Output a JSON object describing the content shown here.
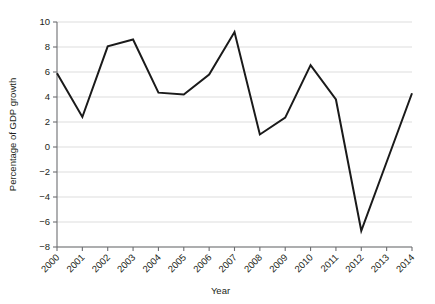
{
  "chart_data": {
    "type": "line",
    "title": "",
    "xlabel": "Year",
    "ylabel": "Percentage of GDP growth",
    "categories": [
      "2000",
      "2001",
      "2002",
      "2003",
      "2004",
      "2005",
      "2006",
      "2007",
      "2008",
      "2009",
      "2010",
      "2011",
      "2012",
      "2013",
      "2014"
    ],
    "x": [
      2000,
      2001,
      2002,
      2003,
      2004,
      2005,
      2006,
      2007,
      2008,
      2009,
      2010,
      2011,
      2012,
      2013,
      2014
    ],
    "values": [
      5.9,
      2.4,
      8.05,
      8.6,
      4.35,
      4.2,
      5.8,
      9.2,
      1.0,
      2.35,
      6.55,
      3.8,
      -6.7,
      -1.2,
      4.3
    ],
    "series": [
      {
        "name": "GDP growth",
        "values": [
          5.9,
          2.4,
          8.05,
          8.6,
          4.35,
          4.2,
          5.8,
          9.2,
          1.0,
          2.35,
          6.55,
          3.8,
          -6.7,
          -1.2,
          4.3
        ]
      }
    ],
    "ylim": [
      -8,
      10
    ],
    "xlim": [
      2000,
      2014
    ],
    "yticks": [
      10,
      8,
      6,
      4,
      2,
      0,
      -2,
      -4,
      -6,
      -8
    ],
    "ytick_labels": [
      "10",
      "8",
      "6",
      "4",
      "2",
      "0",
      "−2",
      "−4",
      "−6",
      "−8"
    ],
    "grid": true,
    "legend": false,
    "legend_position": "none",
    "line_color": "#1a1a1a",
    "grid_color": "#d4d4d4",
    "axis_color": "#6d6e71",
    "xtick_rotation": -45
  }
}
